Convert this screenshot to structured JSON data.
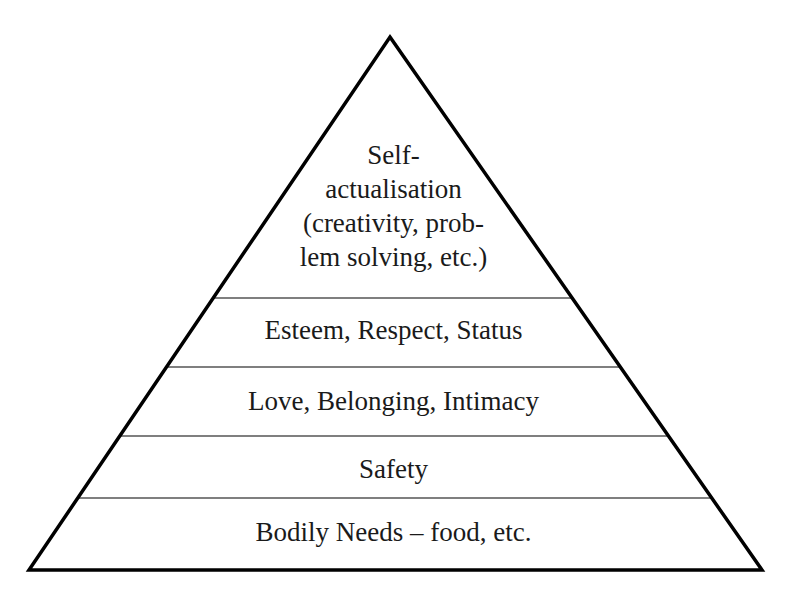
{
  "diagram": {
    "type": "pyramid",
    "apex": [
      390,
      37
    ],
    "base_left": [
      29,
      570
    ],
    "base_right": [
      762,
      570
    ],
    "stroke_color": "#000000",
    "divider_color": "#555555",
    "tiers": [
      {
        "id": "self-actualisation",
        "lines": [
          "Self-",
          "actualisation",
          "(creativity, prob-",
          "lem solving, etc.)"
        ]
      },
      {
        "id": "esteem",
        "label": "Esteem, Respect, Status"
      },
      {
        "id": "love",
        "label": "Love, Belonging, Intimacy"
      },
      {
        "id": "safety",
        "label": "Safety"
      },
      {
        "id": "bodily-needs",
        "label": "Bodily Needs – food, etc."
      }
    ]
  }
}
